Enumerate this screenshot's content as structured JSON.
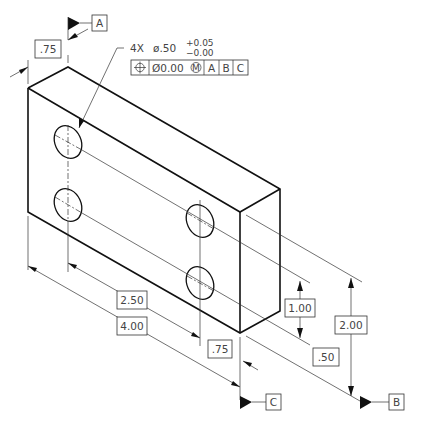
{
  "drawing": {
    "type": "isometric GD&T drawing of rectangular block with four holes",
    "hole_callout": {
      "count": "4X",
      "diameter": "ø.50",
      "tol_plus": "+0.05",
      "tol_minus": "−0.00"
    },
    "feature_control_frame": {
      "symbol": "position",
      "symbol_glyph": "⊕",
      "tolerance": "Ø0.00",
      "modifier": "M",
      "datums": [
        "A",
        "B",
        "C"
      ]
    },
    "datum_labels": {
      "a": "A",
      "b": "B",
      "c": "C"
    },
    "dimensions": {
      "thickness": ".75",
      "hole_x": "2.50",
      "length": "4.00",
      "hole_edge_x": ".75",
      "hole_spacing_y": "1.00",
      "hole_edge_y": ".50",
      "height": "2.00"
    }
  }
}
